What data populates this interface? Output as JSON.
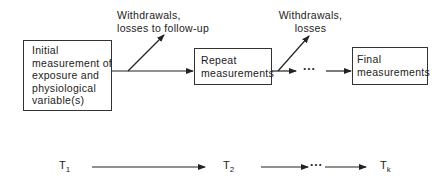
{
  "diagram": {
    "boxes": [
      {
        "id": "initial",
        "lines": [
          "Initial",
          "measurement of",
          "exposure and",
          "physiological",
          "variable(s)"
        ]
      },
      {
        "id": "repeat",
        "lines": [
          "Repeat",
          "measurements"
        ]
      },
      {
        "id": "final",
        "lines": [
          "Final",
          "measurements"
        ]
      }
    ],
    "branch_labels": [
      {
        "id": "withdrawals-1",
        "lines": [
          "Withdrawals,",
          "losses to follow-up"
        ]
      },
      {
        "id": "withdrawals-2",
        "lines": [
          "Withdrawals,",
          "losses"
        ]
      }
    ],
    "ellipsis": "···",
    "timeline": [
      {
        "base": "T",
        "sub": "1"
      },
      {
        "base": "T",
        "sub": "2"
      },
      {
        "base": "T",
        "sub": "k"
      }
    ],
    "colors": {
      "line": "#222222",
      "background": "#ffffff"
    }
  }
}
